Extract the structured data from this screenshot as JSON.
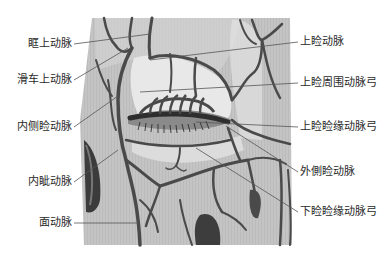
{
  "figure": {
    "colors": {
      "background": "#ffffff",
      "illustration_bg": "#bdbdbd",
      "vessel": "#4a4a4a",
      "leader_line": "#555555",
      "label_text": "#2a2a2a"
    }
  },
  "labels": {
    "left": [
      {
        "id": "supraorbital",
        "text": "眶上动脉",
        "x": 72,
        "y": 44,
        "target": [
          150,
          34
        ]
      },
      {
        "id": "supratrochlear",
        "text": "滑车上动脉",
        "x": 72,
        "y": 80,
        "target": [
          118,
          52
        ]
      },
      {
        "id": "medial_palpebral",
        "text": "内侧睑动脉",
        "x": 72,
        "y": 127,
        "target": [
          117,
          94
        ]
      },
      {
        "id": "angular",
        "text": "内眦动脉",
        "x": 72,
        "y": 182,
        "target": [
          116,
          149
        ]
      },
      {
        "id": "facial",
        "text": "面动脉",
        "x": 72,
        "y": 223,
        "target": [
          140,
          223
        ]
      }
    ],
    "right": [
      {
        "id": "superior_palpebral",
        "text": "上睑动脉",
        "x": 302,
        "y": 42,
        "target": [
          178,
          62
        ]
      },
      {
        "id": "superior_peripheral_arcade",
        "text": "上睑周围动脉弓",
        "x": 302,
        "y": 83,
        "target": [
          162,
          90
        ]
      },
      {
        "id": "superior_marginal_arcade",
        "text": "上睑睑缘动脉弓",
        "x": 302,
        "y": 127,
        "target": [
          198,
          124
        ]
      },
      {
        "id": "lateral_palpebral",
        "text": "外側睑动脉",
        "x": 302,
        "y": 172,
        "target": [
          232,
          124
        ]
      },
      {
        "id": "inferior_marginal_arcade",
        "text": "下睑睑缘动脉弓",
        "x": 302,
        "y": 212,
        "target": [
          200,
          160
        ]
      }
    ]
  }
}
